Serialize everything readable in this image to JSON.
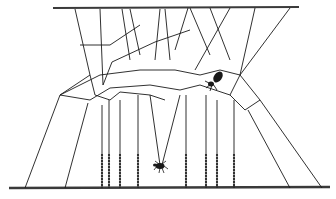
{
  "figure": {
    "line_color": "#1a1a1a",
    "bar_color": "#3a3a3a",
    "background": "#ffffff",
    "top_bar": {
      "x1": 53,
      "y1": 8,
      "x2": 299,
      "y2": 7
    },
    "bottom_bar": {
      "x1": 9,
      "y1": 188,
      "x2": 330,
      "y2": 187
    },
    "threads": [
      [
        75,
        9,
        90,
        75
      ],
      [
        100,
        9,
        103,
        85
      ],
      [
        122,
        9,
        130,
        60
      ],
      [
        130,
        9,
        140,
        55
      ],
      [
        160,
        9,
        155,
        60
      ],
      [
        165,
        9,
        170,
        60
      ],
      [
        188,
        8,
        175,
        50
      ],
      [
        190,
        8,
        210,
        55
      ],
      [
        210,
        8,
        230,
        60
      ],
      [
        230,
        8,
        195,
        70
      ],
      [
        255,
        8,
        240,
        75
      ],
      [
        290,
        8,
        240,
        75
      ],
      [
        90,
        75,
        60,
        95
      ],
      [
        103,
        85,
        112,
        62
      ],
      [
        112,
        62,
        155,
        42
      ],
      [
        155,
        42,
        190,
        30
      ],
      [
        80,
        45,
        110,
        45
      ],
      [
        110,
        45,
        140,
        25
      ],
      [
        60,
        95,
        100,
        75
      ],
      [
        100,
        75,
        140,
        70
      ],
      [
        140,
        70,
        175,
        70
      ],
      [
        175,
        70,
        200,
        75
      ],
      [
        200,
        75,
        220,
        70
      ],
      [
        220,
        70,
        240,
        75
      ],
      [
        60,
        95,
        90,
        100
      ],
      [
        90,
        100,
        110,
        88
      ],
      [
        110,
        88,
        150,
        85
      ],
      [
        150,
        85,
        180,
        90
      ],
      [
        180,
        90,
        200,
        85
      ],
      [
        200,
        85,
        230,
        95
      ],
      [
        90,
        75,
        95,
        95
      ],
      [
        95,
        95,
        110,
        100
      ],
      [
        110,
        100,
        120,
        92
      ],
      [
        120,
        92,
        150,
        95
      ],
      [
        150,
        95,
        165,
        100
      ],
      [
        230,
        95,
        240,
        75
      ],
      [
        240,
        75,
        260,
        100
      ],
      [
        230,
        95,
        245,
        110
      ],
      [
        245,
        110,
        260,
        100
      ],
      [
        60,
        95,
        25,
        188
      ],
      [
        88,
        103,
        65,
        188
      ],
      [
        102,
        105,
        102,
        188
      ],
      [
        109,
        100,
        109,
        188
      ],
      [
        120,
        100,
        120,
        188
      ],
      [
        138,
        95,
        138,
        188
      ],
      [
        186,
        95,
        186,
        188
      ],
      [
        206,
        95,
        206,
        188
      ],
      [
        217,
        100,
        217,
        188
      ],
      [
        234,
        100,
        234,
        188
      ],
      [
        248,
        110,
        290,
        188
      ],
      [
        260,
        100,
        322,
        188
      ],
      [
        150,
        95,
        160,
        165
      ],
      [
        180,
        95,
        162,
        165
      ]
    ],
    "dewdrop_threads": [
      102,
      109,
      120,
      138,
      186,
      206,
      217,
      234
    ],
    "spider": {
      "x": 215,
      "y": 80,
      "label": "spider"
    },
    "fly": {
      "x": 160,
      "y": 166,
      "label": "fly"
    }
  }
}
